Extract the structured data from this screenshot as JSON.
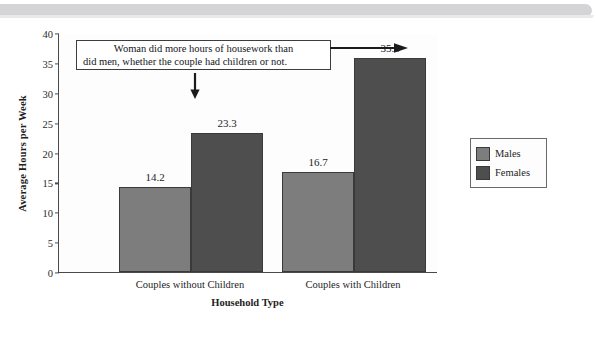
{
  "chart_data": {
    "type": "bar",
    "title": "",
    "subtitle": "",
    "xlabel": "Household Type",
    "ylabel": "Average Hours per Week",
    "categories": [
      "Couples without Children",
      "Couples with Children"
    ],
    "series": [
      {
        "name": "Males",
        "values": [
          14.2,
          16.7
        ],
        "color": "#7d7d7d"
      },
      {
        "name": "Females",
        "values": [
          23.3,
          35.8
        ],
        "color": "#4e4e4e"
      }
    ],
    "ylim": [
      0,
      40
    ],
    "yticks": [
      0,
      5,
      10,
      15,
      20,
      25,
      30,
      35,
      40
    ],
    "ytick_labels": [
      "0",
      "5",
      "10",
      "15",
      "20",
      "25",
      "30",
      "35",
      "40"
    ],
    "grid": false,
    "legend_position": "right",
    "data_labels": [
      "14.2",
      "23.3",
      "16.7",
      "35.8"
    ],
    "annotations": [
      {
        "name": "callout",
        "line1": "Woman did more hours of housework than",
        "line2": "did men, whether the couple had children or not.",
        "arrows": [
          "down-arrow-to-23.3",
          "right-arrow-to-35.8"
        ]
      }
    ]
  },
  "legend": {
    "items": [
      {
        "label": "Males",
        "color": "#7d7d7d"
      },
      {
        "label": "Females",
        "color": "#4e4e4e"
      }
    ]
  },
  "colors": {
    "males": "#7d7d7d",
    "females": "#4e4e4e",
    "axis": "#4a4a4a",
    "band": "#d4d4d6",
    "text": "#1d1d1d"
  }
}
